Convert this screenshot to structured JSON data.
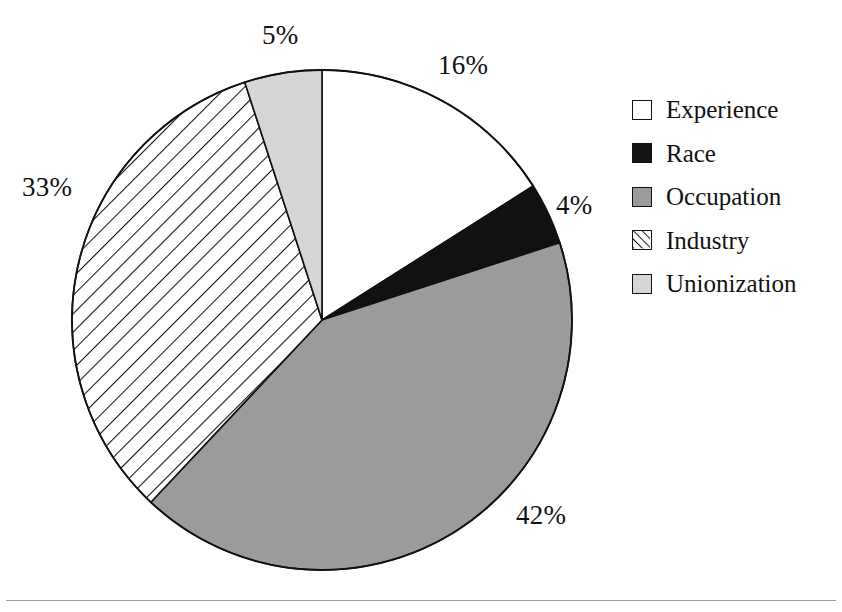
{
  "chart_data": {
    "type": "pie",
    "title": "",
    "subtitle": "",
    "xlabel": "",
    "ylabel": "",
    "unit": "%",
    "start_angle_deg": -90,
    "direction": "clockwise",
    "legend_position": "right",
    "grid": false,
    "categories": [
      "Experience",
      "Race",
      "Occupation",
      "Industry",
      "Unionization"
    ],
    "values": [
      16,
      4,
      42,
      33,
      5
    ],
    "value_labels": [
      "16%",
      "4%",
      "42%",
      "33%",
      "5%"
    ],
    "total": 100,
    "slices": [
      {
        "label": "Experience",
        "value": 16,
        "value_label": "16%",
        "fill": "white",
        "color": "#ffffff",
        "start_deg": -90,
        "sweep_deg": 57.6,
        "label_x": 470,
        "label_y": 53
      },
      {
        "label": "Race",
        "value": 4,
        "value_label": "4%",
        "fill": "solid-black",
        "color": "#111111",
        "start_deg": -32.4,
        "sweep_deg": 14.4,
        "label_x": 558,
        "label_y": 192
      },
      {
        "label": "Occupation",
        "value": 42,
        "value_label": "42%",
        "fill": "medium-gray",
        "color": "#9b9b9b",
        "start_deg": -18,
        "sweep_deg": 151.2,
        "label_x": 517,
        "label_y": 500
      },
      {
        "label": "Industry",
        "value": 33,
        "value_label": "33%",
        "fill": "diagonal-hatch",
        "color": "#ffffff",
        "start_deg": 133.2,
        "sweep_deg": 118.8,
        "label_x": 24,
        "label_y": 174
      },
      {
        "label": "Unionization",
        "value": 5,
        "value_label": "5%",
        "fill": "light-gray",
        "color": "#d6d6d6",
        "start_deg": -108,
        "sweep_deg": 18,
        "label_x": 262,
        "label_y": 20
      }
    ]
  },
  "legend": {
    "items": [
      {
        "label": "Experience",
        "swatch": "white-swatch"
      },
      {
        "label": "Race",
        "swatch": "black-swatch"
      },
      {
        "label": "Occupation",
        "swatch": "gray-swatch"
      },
      {
        "label": "Industry",
        "swatch": "hatched-swatch"
      },
      {
        "label": "Unionization",
        "swatch": "light-gray-swatch"
      }
    ]
  },
  "colors": {
    "outline": "#111111",
    "occupation_gray": "#9b9b9b",
    "unionization_gray": "#d6d6d6",
    "race_black": "#111111",
    "experience_white": "#ffffff",
    "rule": "#9d9d9d"
  }
}
